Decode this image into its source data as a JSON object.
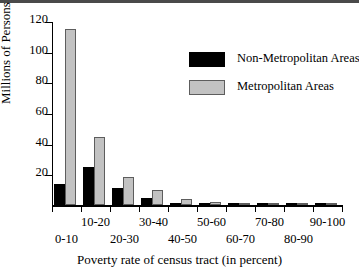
{
  "chart_data": {
    "type": "bar",
    "title": "",
    "xlabel": "Poverty rate of census tract (in percent)",
    "ylabel": "Millions of Persons",
    "categories": [
      "0-10",
      "10-20",
      "20-30",
      "30-40",
      "40-50",
      "50-60",
      "60-70",
      "70-80",
      "80-90",
      "90-100"
    ],
    "series": [
      {
        "name": "Non-Metropolitan Areas",
        "color": "#000000",
        "values": [
          14,
          25,
          11,
          4.5,
          1.5,
          0.6,
          0.2,
          0.1,
          0.05,
          0.05
        ]
      },
      {
        "name": "Metropolitan Areas",
        "color": "#c2c2c2",
        "values": [
          114.5,
          44.5,
          18.5,
          10,
          4,
          2,
          0.7,
          0.2,
          0.1,
          0.1
        ]
      }
    ],
    "ylim": [
      0,
      120
    ],
    "yticks": [
      0,
      20,
      40,
      60,
      80,
      100,
      120
    ],
    "ytick_labels": [
      "",
      "20",
      "40",
      "60",
      "80",
      "100",
      "120"
    ],
    "grid": false,
    "legend_position": "upper right"
  },
  "legend": {
    "entries": [
      {
        "label": "Non-Metropolitan Areas",
        "swatch": "nonmetro"
      },
      {
        "label": "Metropolitan Areas",
        "swatch": "metro"
      }
    ]
  },
  "axes": {
    "y_title": "Millions of Persons",
    "x_title": "Poverty rate of census tract (in percent)"
  }
}
